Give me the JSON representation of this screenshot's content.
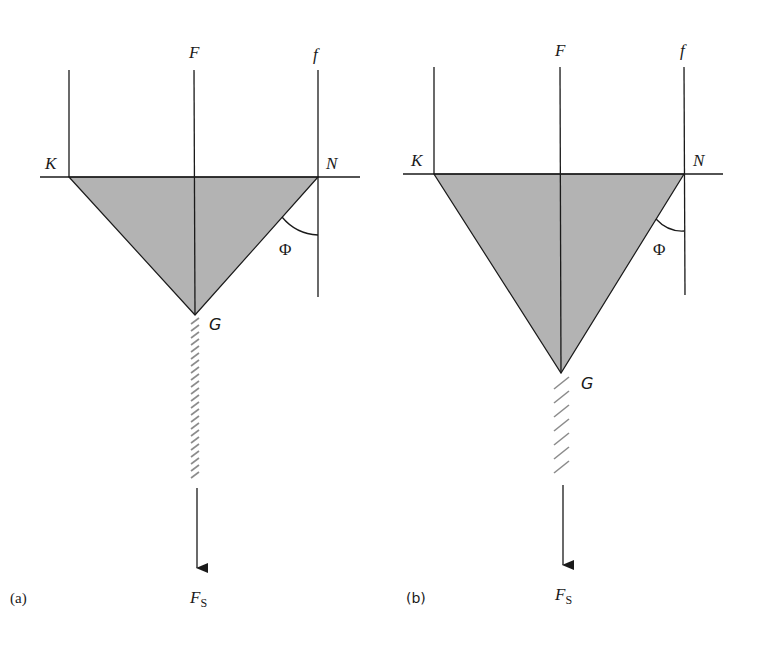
{
  "figure": {
    "colors": {
      "fill": "#b3b3b3",
      "line": "#1a1a1a",
      "hatch": "#8c8c8c",
      "background": "#ffffff"
    },
    "panels": [
      {
        "id": "a",
        "caption": "(a)",
        "labels": {
          "F": "F",
          "f": "f",
          "K": "K",
          "N": "N",
          "G": "G",
          "angle": "Φ",
          "force": "F",
          "force_sub": "S"
        },
        "description": "Shaded triangle KNG hanging from line KN with vertical lines K, F, f; angle Φ between edge NG and line f; dense hatched spring below G and downward arrow F_S"
      },
      {
        "id": "b",
        "caption": "(b)",
        "labels": {
          "F": "F",
          "f": "f",
          "K": "K",
          "N": "N",
          "G": "G",
          "angle": "Φ",
          "force": "F",
          "force_sub": "S"
        },
        "description": "Deeper shaded triangle KNG with smaller angle Φ; sparser hatched spring below G and downward arrow F_S"
      }
    ]
  }
}
